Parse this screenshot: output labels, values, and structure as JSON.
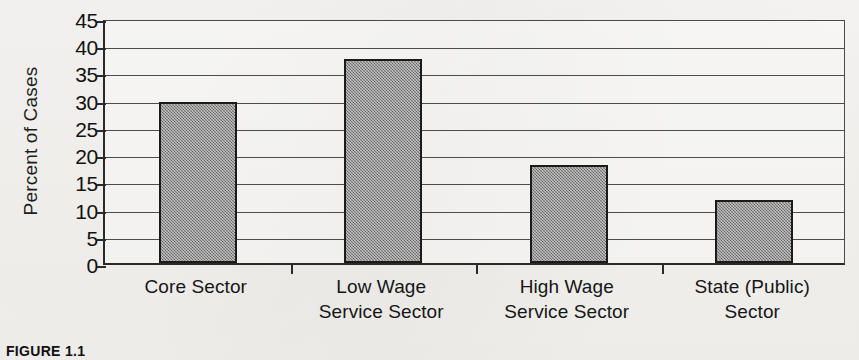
{
  "caption": "FIGURE 1.1",
  "chart_data": {
    "type": "bar",
    "title": "",
    "subtitle": "",
    "xlabel": "",
    "ylabel": "Percent of Cases",
    "ylim": [
      0,
      45
    ],
    "ytick_step": 5,
    "yticks": [
      45,
      40,
      35,
      30,
      25,
      20,
      15,
      10,
      5,
      0
    ],
    "ytick_labels": [
      "45",
      "40",
      "35",
      "30",
      "25",
      "20",
      "15",
      "10",
      "5",
      "0"
    ],
    "grid": true,
    "grid_axis": "y",
    "legend": false,
    "legend_position": "none",
    "categories": [
      "Core Sector",
      "Low Wage Service Sector",
      "High Wage Service Sector",
      "State (Public) Sector"
    ],
    "category_label_lines": [
      [
        "Core Sector",
        ""
      ],
      [
        "Low Wage",
        "Service Sector"
      ],
      [
        "High Wage",
        "Service Sector"
      ],
      [
        "State (Public)",
        "Sector"
      ]
    ],
    "values": [
      29.5,
      37.5,
      18.0,
      11.5
    ],
    "bar_color": "#8a8a8a",
    "bar_edge_color": "#1b1b1b",
    "axis_color": "#2a2a2a",
    "gridline_color": "#4c4c4c",
    "background_color": "#f6f5f3"
  }
}
